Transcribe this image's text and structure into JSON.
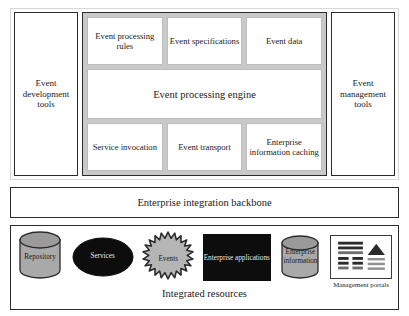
{
  "diagram": {
    "colors": {
      "engine_group_fill": "#c9c9c9",
      "box_border": "#2b2b2b",
      "inner_box_fill": "#ffffff",
      "black_fill": "#0d0d0d",
      "shape_gray": "#a9a9a9",
      "page_background": "#ffffff"
    }
  },
  "platform": {
    "left_column": {
      "label": "Event development tools",
      "line1": "Event",
      "line2": "development",
      "line3": "tools"
    },
    "right_column": {
      "label": "Event management tools",
      "line1": "Event",
      "line2": "management",
      "line3": "tools"
    },
    "top_row": [
      {
        "label": "Event processing rules"
      },
      {
        "label": "Event specifications"
      },
      {
        "label": "Event data"
      }
    ],
    "core": {
      "label": "Event processing engine"
    },
    "bottom_row": [
      {
        "label": "Service invocation"
      },
      {
        "label": "Event transport"
      },
      {
        "label": "Enterprise information caching"
      }
    ]
  },
  "backbone": {
    "label": "Enterprise integration backbone"
  },
  "resources": {
    "caption": "Integrated resources",
    "items": [
      {
        "label": "Repository",
        "icon": "cylinder-icon",
        "fill": "#a9a9a9",
        "text_color": "dark"
      },
      {
        "label": "Services",
        "icon": "ellipse-icon",
        "fill": "#0d0d0d",
        "text_color": "light"
      },
      {
        "label": "Events",
        "icon": "starburst-icon",
        "fill": "#b5b5b5",
        "text_color": "dark"
      },
      {
        "label": "Enterprise applications",
        "icon": "rectangle-icon",
        "fill": "#0d0d0d",
        "text_color": "light"
      },
      {
        "label": "Enterprise information",
        "icon": "cylinder-icon",
        "fill": "#a9a9a9",
        "text_color": "dark"
      },
      {
        "label": "Management portals",
        "icon": "window-icon",
        "fill": "#ffffff",
        "text_color": "dark"
      }
    ]
  }
}
